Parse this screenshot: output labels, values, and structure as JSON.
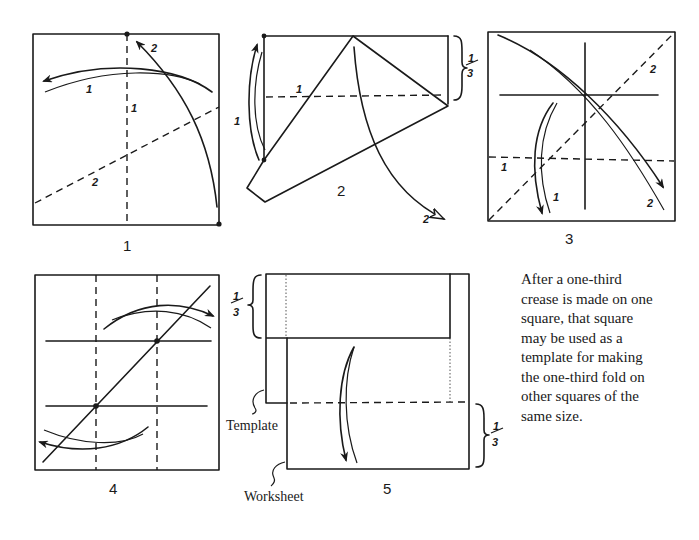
{
  "figures": {
    "fig1": {
      "label": "1",
      "arrow_labels": [
        "1",
        "1",
        "2",
        "2"
      ]
    },
    "fig2": {
      "label": "2",
      "arrow_labels": [
        "1",
        "1",
        "2"
      ],
      "fraction_num": "1",
      "fraction_den": "3"
    },
    "fig3": {
      "label": "3",
      "arrow_labels": [
        "1",
        "1",
        "2",
        "2"
      ]
    },
    "fig4": {
      "label": "4"
    },
    "fig5": {
      "label": "5",
      "template_label": "Template",
      "worksheet_label": "Worksheet",
      "fraction_top_num": "1",
      "fraction_top_den": "3",
      "fraction_bottom_num": "1",
      "fraction_bottom_den": "3"
    }
  },
  "note": {
    "lines": [
      "After a one-third",
      "crease is made on one",
      "square, that square",
      "may be used as a",
      "template for making",
      "the one-third fold on",
      "other squares of the",
      "same size."
    ]
  },
  "colors": {
    "ink": "#1a1a1a",
    "paper": "#ffffff"
  }
}
